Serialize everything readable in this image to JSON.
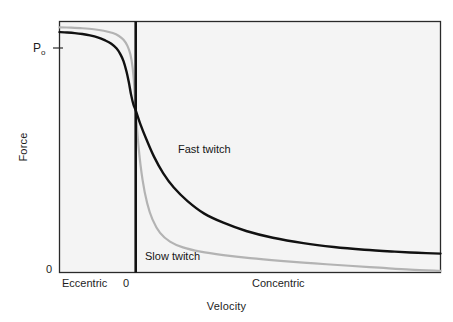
{
  "figure": {
    "background_color": "#ffffff",
    "plot_background_color": "#f4f4f4",
    "frame_color": "#2a2a2a"
  },
  "axes": {
    "y_title": "Force",
    "x_title": "Velocity",
    "y_ticks": [
      {
        "label": "P",
        "sublabel": "o",
        "has_tick_mark": true
      },
      {
        "label": "0",
        "sublabel": "",
        "has_tick_mark": false
      }
    ],
    "x_ticks": [
      {
        "label": "Eccentric"
      },
      {
        "label": "0"
      },
      {
        "label": "Concentric"
      }
    ]
  },
  "annotations": {
    "fast_twitch_label": "Fast twitch",
    "slow_twitch_label": "Slow twitch"
  },
  "chart_data": {
    "type": "line",
    "title": "",
    "subtitle": "",
    "xlabel": "Velocity",
    "ylabel": "Force",
    "xlim": [
      -1,
      4
    ],
    "ylim": [
      0,
      1.3
    ],
    "x_tick_labels": [
      "Eccentric",
      "0",
      "Concentric"
    ],
    "x_tick_values": [
      -0.55,
      0,
      2.15
    ],
    "y_tick_labels": [
      "Pₒ",
      "0"
    ],
    "y_tick_values": [
      1.12,
      0
    ],
    "grid": false,
    "legend": "inline-annotations",
    "zero_line": {
      "x": 0,
      "color": "#111111",
      "width_px": 2.6
    },
    "series": [
      {
        "name": "Fast twitch",
        "color": "#111111",
        "width_px": 2.4,
        "label_position": {
          "x": 1.05,
          "y": 0.62
        },
        "points": [
          {
            "x": -1.0,
            "y": 1.245
          },
          {
            "x": -0.9,
            "y": 1.243
          },
          {
            "x": -0.8,
            "y": 1.24
          },
          {
            "x": -0.7,
            "y": 1.235
          },
          {
            "x": -0.6,
            "y": 1.228
          },
          {
            "x": -0.5,
            "y": 1.218
          },
          {
            "x": -0.4,
            "y": 1.202
          },
          {
            "x": -0.32,
            "y": 1.185
          },
          {
            "x": -0.25,
            "y": 1.16
          },
          {
            "x": -0.2,
            "y": 1.13
          },
          {
            "x": -0.16,
            "y": 1.095
          },
          {
            "x": -0.12,
            "y": 1.04
          },
          {
            "x": -0.09,
            "y": 0.985
          },
          {
            "x": -0.06,
            "y": 0.92
          },
          {
            "x": -0.03,
            "y": 0.87
          },
          {
            "x": 0.0,
            "y": 0.84
          },
          {
            "x": 0.06,
            "y": 0.77
          },
          {
            "x": 0.14,
            "y": 0.69
          },
          {
            "x": 0.24,
            "y": 0.6
          },
          {
            "x": 0.36,
            "y": 0.515
          },
          {
            "x": 0.5,
            "y": 0.44
          },
          {
            "x": 0.68,
            "y": 0.37
          },
          {
            "x": 0.9,
            "y": 0.305
          },
          {
            "x": 1.15,
            "y": 0.258
          },
          {
            "x": 1.45,
            "y": 0.215
          },
          {
            "x": 1.8,
            "y": 0.18
          },
          {
            "x": 2.2,
            "y": 0.152
          },
          {
            "x": 2.6,
            "y": 0.132
          },
          {
            "x": 3.0,
            "y": 0.118
          },
          {
            "x": 3.4,
            "y": 0.108
          },
          {
            "x": 3.7,
            "y": 0.102
          },
          {
            "x": 4.0,
            "y": 0.098
          }
        ]
      },
      {
        "name": "Slow twitch",
        "color": "#b3b3b3",
        "width_px": 2.2,
        "label_position": {
          "x": 0.3,
          "y": 0.095
        },
        "points": [
          {
            "x": -1.0,
            "y": 1.27
          },
          {
            "x": -0.85,
            "y": 1.268
          },
          {
            "x": -0.7,
            "y": 1.265
          },
          {
            "x": -0.55,
            "y": 1.26
          },
          {
            "x": -0.42,
            "y": 1.252
          },
          {
            "x": -0.3,
            "y": 1.24
          },
          {
            "x": -0.22,
            "y": 1.225
          },
          {
            "x": -0.16,
            "y": 1.205
          },
          {
            "x": -0.11,
            "y": 1.175
          },
          {
            "x": -0.07,
            "y": 1.13
          },
          {
            "x": -0.04,
            "y": 1.06
          },
          {
            "x": -0.02,
            "y": 0.97
          },
          {
            "x": 0.0,
            "y": 0.84
          },
          {
            "x": 0.04,
            "y": 0.64
          },
          {
            "x": 0.09,
            "y": 0.48
          },
          {
            "x": 0.15,
            "y": 0.36
          },
          {
            "x": 0.22,
            "y": 0.275
          },
          {
            "x": 0.32,
            "y": 0.205
          },
          {
            "x": 0.45,
            "y": 0.16
          },
          {
            "x": 0.62,
            "y": 0.13
          },
          {
            "x": 0.85,
            "y": 0.108
          },
          {
            "x": 1.15,
            "y": 0.09
          },
          {
            "x": 1.5,
            "y": 0.074
          },
          {
            "x": 1.9,
            "y": 0.06
          },
          {
            "x": 2.35,
            "y": 0.047
          },
          {
            "x": 2.8,
            "y": 0.035
          },
          {
            "x": 3.2,
            "y": 0.025
          },
          {
            "x": 3.6,
            "y": 0.015
          },
          {
            "x": 4.0,
            "y": 0.008
          }
        ]
      }
    ]
  }
}
